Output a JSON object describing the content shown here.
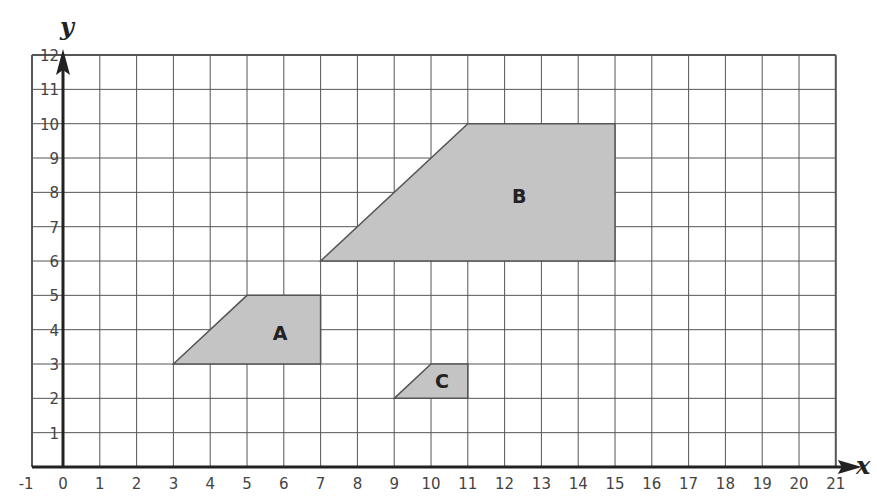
{
  "diagram": {
    "type": "coordinate-grid-with-shapes",
    "axes": {
      "x_label": "x",
      "y_label": "y",
      "x_range": [
        -1,
        21
      ],
      "y_range": [
        0,
        12
      ],
      "x_ticks": [
        "-1",
        "0",
        "1",
        "2",
        "3",
        "4",
        "5",
        "6",
        "7",
        "8",
        "9",
        "10",
        "11",
        "12",
        "13",
        "14",
        "15",
        "16",
        "17",
        "18",
        "19",
        "20",
        "21"
      ],
      "y_ticks": [
        "1",
        "2",
        "3",
        "4",
        "5",
        "6",
        "7",
        "8",
        "9",
        "10",
        "11",
        "12"
      ]
    },
    "shapes": [
      {
        "label": "A",
        "vertices": [
          [
            3,
            3
          ],
          [
            5,
            5
          ],
          [
            7,
            5
          ],
          [
            7,
            3
          ]
        ],
        "label_pos": [
          5.9,
          3.9
        ]
      },
      {
        "label": "B",
        "vertices": [
          [
            7,
            6
          ],
          [
            11,
            10
          ],
          [
            15,
            10
          ],
          [
            15,
            6
          ]
        ],
        "label_pos": [
          12.4,
          7.9
        ]
      },
      {
        "label": "C",
        "vertices": [
          [
            9,
            2
          ],
          [
            10,
            3
          ],
          [
            11,
            3
          ],
          [
            11,
            2
          ]
        ],
        "label_pos": [
          10.3,
          2.5
        ]
      }
    ],
    "colors": {
      "grid": "#555555",
      "axis": "#222222",
      "shape_fill": "#c4c4c4",
      "shape_stroke": "#555555"
    }
  }
}
